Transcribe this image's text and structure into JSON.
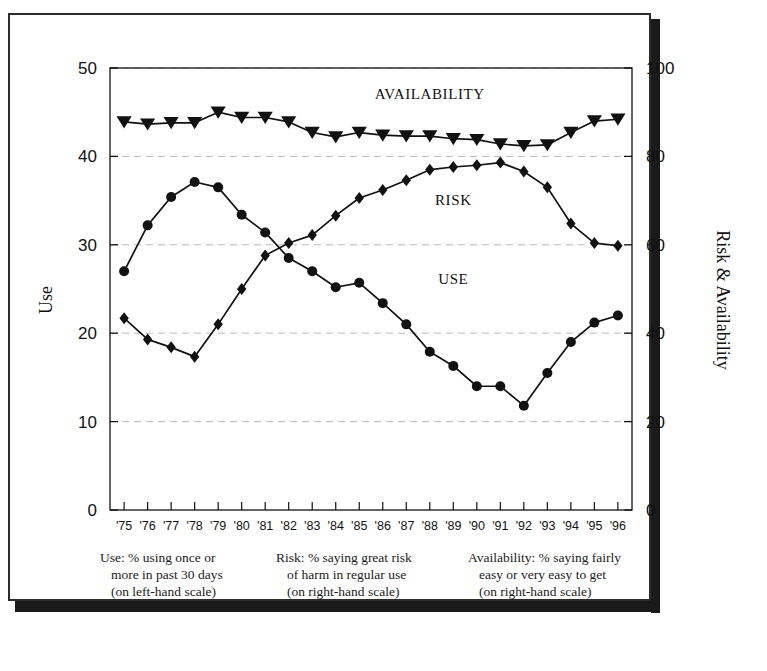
{
  "chart_data": {
    "type": "line",
    "title": "",
    "xlabel": "",
    "ylabel": "Use",
    "y2label": "Risk & Availability",
    "categories": [
      "'75",
      "'76",
      "'77",
      "'78",
      "'79",
      "'80",
      "'81",
      "'82",
      "'83",
      "'84",
      "'85",
      "'86",
      "'87",
      "'88",
      "'89",
      "'90",
      "'91",
      "'92",
      "'93",
      "'94",
      "'95",
      "'96"
    ],
    "x_tick_labels": [
      "'75",
      "'76",
      "'77",
      "'78",
      "'79",
      "'80",
      "'81",
      "'82",
      "'83",
      "'84",
      "'85",
      "'86",
      "'87",
      "'88",
      "'89",
      "'90",
      "'91",
      "'92",
      "'93",
      "'94",
      "'95",
      "'96"
    ],
    "ylim": [
      0,
      50
    ],
    "y_ticks": [
      0,
      10,
      20,
      30,
      40,
      50
    ],
    "y2lim": [
      0,
      100
    ],
    "y2_ticks": [
      0,
      20,
      40,
      60,
      80,
      100
    ],
    "grid": true,
    "legend_position": "inline-annotations",
    "series": [
      {
        "name": "USE",
        "axis": "left",
        "marker": "circle",
        "label_text": "USE",
        "values": [
          27.0,
          32.2,
          35.4,
          37.1,
          36.5,
          33.4,
          31.4,
          28.5,
          27.0,
          25.2,
          25.7,
          23.4,
          21.0,
          17.9,
          16.3,
          14.0,
          14.0,
          11.8,
          15.5,
          19.0,
          21.2,
          22.0
        ]
      },
      {
        "name": "RISK",
        "axis": "right",
        "marker": "diamond",
        "label_text": "RISK",
        "values": [
          43.4,
          38.6,
          36.8,
          34.7,
          42.0,
          50.0,
          57.6,
          60.4,
          62.2,
          66.6,
          70.6,
          72.4,
          74.6,
          77.0,
          77.6,
          78.0,
          78.6,
          76.6,
          73.0,
          64.8,
          60.4,
          59.8
        ]
      },
      {
        "name": "AVAILABILITY",
        "axis": "right",
        "marker": "triangle-down",
        "label_text": "AVAILABILITY",
        "values": [
          87.8,
          87.3,
          87.6,
          87.6,
          90.0,
          88.8,
          88.8,
          87.8,
          85.4,
          84.4,
          85.4,
          84.8,
          84.6,
          84.6,
          84.0,
          83.8,
          82.8,
          82.4,
          82.6,
          85.4,
          88.0,
          88.4
        ]
      }
    ],
    "annotations": [
      {
        "name": "availability-label",
        "text": "AVAILABILITY",
        "x_category": "'88",
        "value": 93.0
      },
      {
        "name": "risk-label",
        "text": "RISK",
        "x_category": "'89",
        "value": 69.0
      },
      {
        "name": "use-label",
        "text": "USE",
        "x_category": "'89",
        "value": 25.6
      }
    ]
  },
  "captions": [
    {
      "name": "use-caption",
      "lines": [
        "Use:  % using once or",
        "more in past 30 days",
        "(on left-hand scale)"
      ]
    },
    {
      "name": "risk-caption",
      "lines": [
        "Risk:  % saying great risk",
        "of harm in regular use",
        "(on right-hand scale)"
      ]
    },
    {
      "name": "availability-caption",
      "lines": [
        "Availability:  % saying fairly",
        "easy or very easy to get",
        "(on right-hand scale)"
      ]
    }
  ],
  "colors": {
    "ink": "#111111",
    "grid": "#bbbbbb",
    "frame": "#2c2c2c",
    "shadow": "#1a1a1a",
    "background": "#ffffff"
  }
}
